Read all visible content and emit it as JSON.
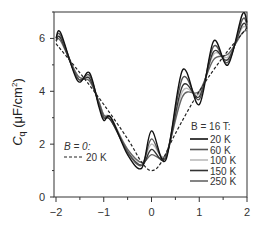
{
  "chart_data": {
    "type": "line",
    "title": "",
    "xlabel": "",
    "ylabel": "C_q (μF/cm²)",
    "ylabel_main": "C",
    "ylabel_sub": "q",
    "ylabel_unit": " (μF/cm",
    "ylabel_sup": "2",
    "ylabel_close": ")",
    "xlim": [
      -2,
      2
    ],
    "ylim": [
      0,
      7
    ],
    "xticks": [
      "-2",
      "-1",
      "0",
      "1",
      "2"
    ],
    "yticks": [
      "0",
      "2",
      "4",
      "6"
    ],
    "legend_b0_title": "B = 0:",
    "legend_b0_entry": "20 K",
    "legend_b16_title": "B = 16 T:",
    "series": [
      {
        "name": "B = 0: 20 K",
        "style": "dashed",
        "color": "#222222",
        "x": [
          -2,
          -1.5,
          -1,
          -0.5,
          -0.2,
          0,
          0.2,
          0.5,
          1,
          1.5,
          2
        ],
        "values": [
          5.8,
          4.7,
          3.5,
          2.2,
          1.3,
          1.0,
          1.3,
          2.4,
          4.0,
          5.3,
          6.4
        ]
      },
      {
        "name": "B = 16 T: 20 K",
        "style": "solid",
        "color": "#111111",
        "x": [
          -2,
          -1.9,
          -1.55,
          -1.3,
          -1.1,
          -1.0,
          -0.85,
          -0.5,
          -0.2,
          0,
          0.3,
          0.65,
          1.0,
          1.3,
          1.6,
          1.9,
          2
        ],
        "values": [
          6.0,
          6.2,
          4.4,
          4.7,
          3.4,
          2.9,
          3.0,
          1.6,
          1.1,
          2.5,
          1.4,
          4.8,
          3.5,
          5.9,
          5.0,
          6.9,
          6.6
        ]
      },
      {
        "name": "B = 16 T: 60 K",
        "style": "solid",
        "color": "#555555",
        "x": [
          -2,
          -1.9,
          -1.55,
          -1.3,
          -1.1,
          -1.0,
          -0.85,
          -0.5,
          -0.2,
          0,
          0.3,
          0.65,
          1.0,
          1.3,
          1.6,
          1.9,
          2
        ],
        "values": [
          6.0,
          6.1,
          4.5,
          4.6,
          3.5,
          3.0,
          3.0,
          1.7,
          1.2,
          2.2,
          1.5,
          4.5,
          3.7,
          5.7,
          5.1,
          6.7,
          6.5
        ]
      },
      {
        "name": "B = 16 T: 100 K",
        "style": "solid",
        "color": "#bbbbbb",
        "x": [
          -2,
          -1.9,
          -1.55,
          -1.3,
          -1.1,
          -1.0,
          -0.85,
          -0.5,
          -0.2,
          0,
          0.3,
          0.65,
          1.0,
          1.3,
          1.6,
          1.9,
          2
        ],
        "values": [
          5.9,
          6.0,
          4.6,
          4.5,
          3.6,
          3.1,
          3.0,
          1.8,
          1.3,
          2.0,
          1.6,
          4.0,
          3.9,
          5.4,
          5.3,
          6.4,
          6.3
        ]
      },
      {
        "name": "B = 16 T: 150 K",
        "style": "solid",
        "color": "#333333",
        "x": [
          -2,
          -1.9,
          -1.55,
          -1.3,
          -1.1,
          -1.0,
          -0.85,
          -0.5,
          -0.2,
          0,
          0.3,
          0.65,
          1.0,
          1.3,
          1.6,
          1.9,
          2
        ],
        "values": [
          5.9,
          6.0,
          4.5,
          4.5,
          3.5,
          3.0,
          2.9,
          1.7,
          1.2,
          1.8,
          1.5,
          4.2,
          3.8,
          5.5,
          5.2,
          6.5,
          6.4
        ]
      },
      {
        "name": "B = 16 T: 250 K",
        "style": "solid",
        "color": "#666666",
        "x": [
          -2,
          -1.9,
          -1.55,
          -1.3,
          -1.1,
          -1.0,
          -0.85,
          -0.5,
          -0.2,
          0,
          0.3,
          0.65,
          1.0,
          1.3,
          1.6,
          1.9,
          2
        ],
        "values": [
          5.9,
          5.9,
          4.6,
          4.4,
          3.6,
          3.1,
          2.9,
          1.8,
          1.3,
          1.6,
          1.6,
          3.8,
          4.0,
          5.2,
          5.4,
          6.2,
          6.3
        ]
      }
    ],
    "legend_entries": [
      "20 K",
      "60 K",
      "100 K",
      "150 K",
      "250 K"
    ],
    "grid": false
  }
}
